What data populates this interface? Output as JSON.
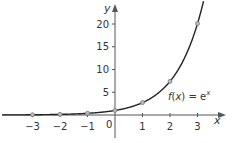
{
  "chart_data": {
    "type": "line",
    "title": "",
    "function_label": "f(x) = e^x",
    "label_parts": {
      "f": "f",
      "open": "(",
      "x": "x",
      "close": ")",
      "eq": " = e",
      "exp": "x"
    },
    "xlabel": "x",
    "ylabel": "y",
    "origin_label": "0",
    "xlim": [
      -4.1,
      4.0
    ],
    "ylim": [
      -4,
      25
    ],
    "x_ticks": [
      -3,
      -2,
      -1,
      1,
      2,
      3
    ],
    "x_tick_labels": [
      "−3",
      "−2",
      "−1",
      "1",
      "2",
      "3"
    ],
    "y_ticks": [
      5,
      10,
      15,
      20
    ],
    "y_tick_labels": [
      "5",
      "10",
      "15",
      "20"
    ],
    "grid": false,
    "legend": null,
    "series": [
      {
        "name": "f(x) = e^x",
        "curve": "exp",
        "points": {
          "x": [
            -3,
            -2,
            -1,
            0,
            1,
            2,
            3
          ],
          "y": [
            0.05,
            0.14,
            0.37,
            1.0,
            2.72,
            7.39,
            20.09
          ]
        }
      }
    ],
    "colors": {
      "axis": "#555555",
      "curve": "#222222",
      "marker_fill": "#bbbbbb",
      "marker_stroke": "#777777",
      "text": "#333333"
    }
  }
}
